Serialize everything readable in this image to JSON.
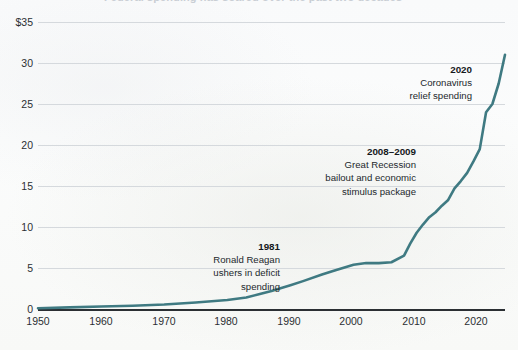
{
  "title": "Federal spending has soared over the past two decades",
  "axes": {
    "y_ticks": [
      {
        "label": "$35",
        "value": 35
      },
      {
        "label": "30",
        "value": 30
      },
      {
        "label": "25",
        "value": 25
      },
      {
        "label": "20",
        "value": 20
      },
      {
        "label": "15",
        "value": 15
      },
      {
        "label": "10",
        "value": 10
      },
      {
        "label": "5",
        "value": 5
      },
      {
        "label": "0",
        "value": 0
      }
    ],
    "x_ticks": [
      {
        "label": "1950",
        "value": 1950
      },
      {
        "label": "1960",
        "value": 1960
      },
      {
        "label": "1970",
        "value": 1970
      },
      {
        "label": "1980",
        "value": 1980
      },
      {
        "label": "1990",
        "value": 1990
      },
      {
        "label": "2000",
        "value": 2000
      },
      {
        "label": "2010",
        "value": 2010
      },
      {
        "label": "2020",
        "value": 2020
      }
    ]
  },
  "annotations": [
    {
      "id": "reagan",
      "year": "1981",
      "line1": "Ronald Reagan",
      "line2": "ushers in deficit",
      "line3": "spending",
      "line4": ""
    },
    {
      "id": "great-recession",
      "year": "2008–2009",
      "line1": "Great Recession",
      "line2": "bailout and economic",
      "line3": "stimulus package",
      "line4": ""
    },
    {
      "id": "covid",
      "year": "2020",
      "line1": "Coronavirus",
      "line2": "relief spending",
      "line3": "",
      "line4": ""
    }
  ],
  "colors": {
    "line": "#3f7a82",
    "axis": "#2b2f33",
    "grid": "#d5d9dd",
    "text": "#23282c",
    "background": "#f9fafb"
  },
  "chart_data": {
    "type": "line",
    "title": "Federal spending has soared over the past two decades",
    "subtitle": "",
    "xlabel": "",
    "ylabel": "",
    "xlim": [
      1950,
      2024
    ],
    "ylim": [
      0,
      35
    ],
    "grid": true,
    "legend": "none",
    "y_unit": "trillions of dollars",
    "series": [
      {
        "name": "Federal spending",
        "x": [
          1950,
          1955,
          1960,
          1965,
          1970,
          1975,
          1980,
          1983,
          1985,
          1987,
          1990,
          1992,
          1995,
          1997,
          2000,
          2002,
          2004,
          2006,
          2008,
          2009,
          2010,
          2011,
          2012,
          2013,
          2014,
          2015,
          2016,
          2017,
          2018,
          2019,
          2020,
          2021,
          2022,
          2023,
          2024
        ],
        "values": [
          0.1,
          0.2,
          0.3,
          0.4,
          0.55,
          0.8,
          1.1,
          1.4,
          1.8,
          2.2,
          2.9,
          3.4,
          4.2,
          4.7,
          5.4,
          5.6,
          5.6,
          5.7,
          6.5,
          8.0,
          9.3,
          10.3,
          11.2,
          11.8,
          12.6,
          13.3,
          14.7,
          15.6,
          16.6,
          18.0,
          19.5,
          24.0,
          25.0,
          27.5,
          31.0
        ]
      }
    ]
  }
}
